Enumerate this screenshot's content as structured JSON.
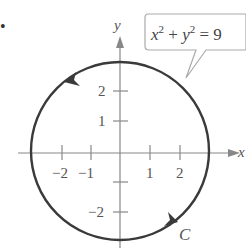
{
  "figure": {
    "bullet": "•",
    "equation_base_x": "x",
    "equation_exp_x": "2",
    "equation_plus": " + ",
    "equation_base_y": "y",
    "equation_exp_y": "2",
    "equation_rhs": " = 9",
    "curve_label": "C",
    "x_axis_label": "x",
    "y_axis_label": "y",
    "x_ticks": [
      "−2",
      "−1",
      "1",
      "2"
    ],
    "y_ticks": [
      "2",
      "1",
      "−2"
    ]
  },
  "colors": {
    "curve": "#3a3a3a",
    "axis": "#888888",
    "text": "#555555",
    "callout_border": "#aaaaaa"
  }
}
